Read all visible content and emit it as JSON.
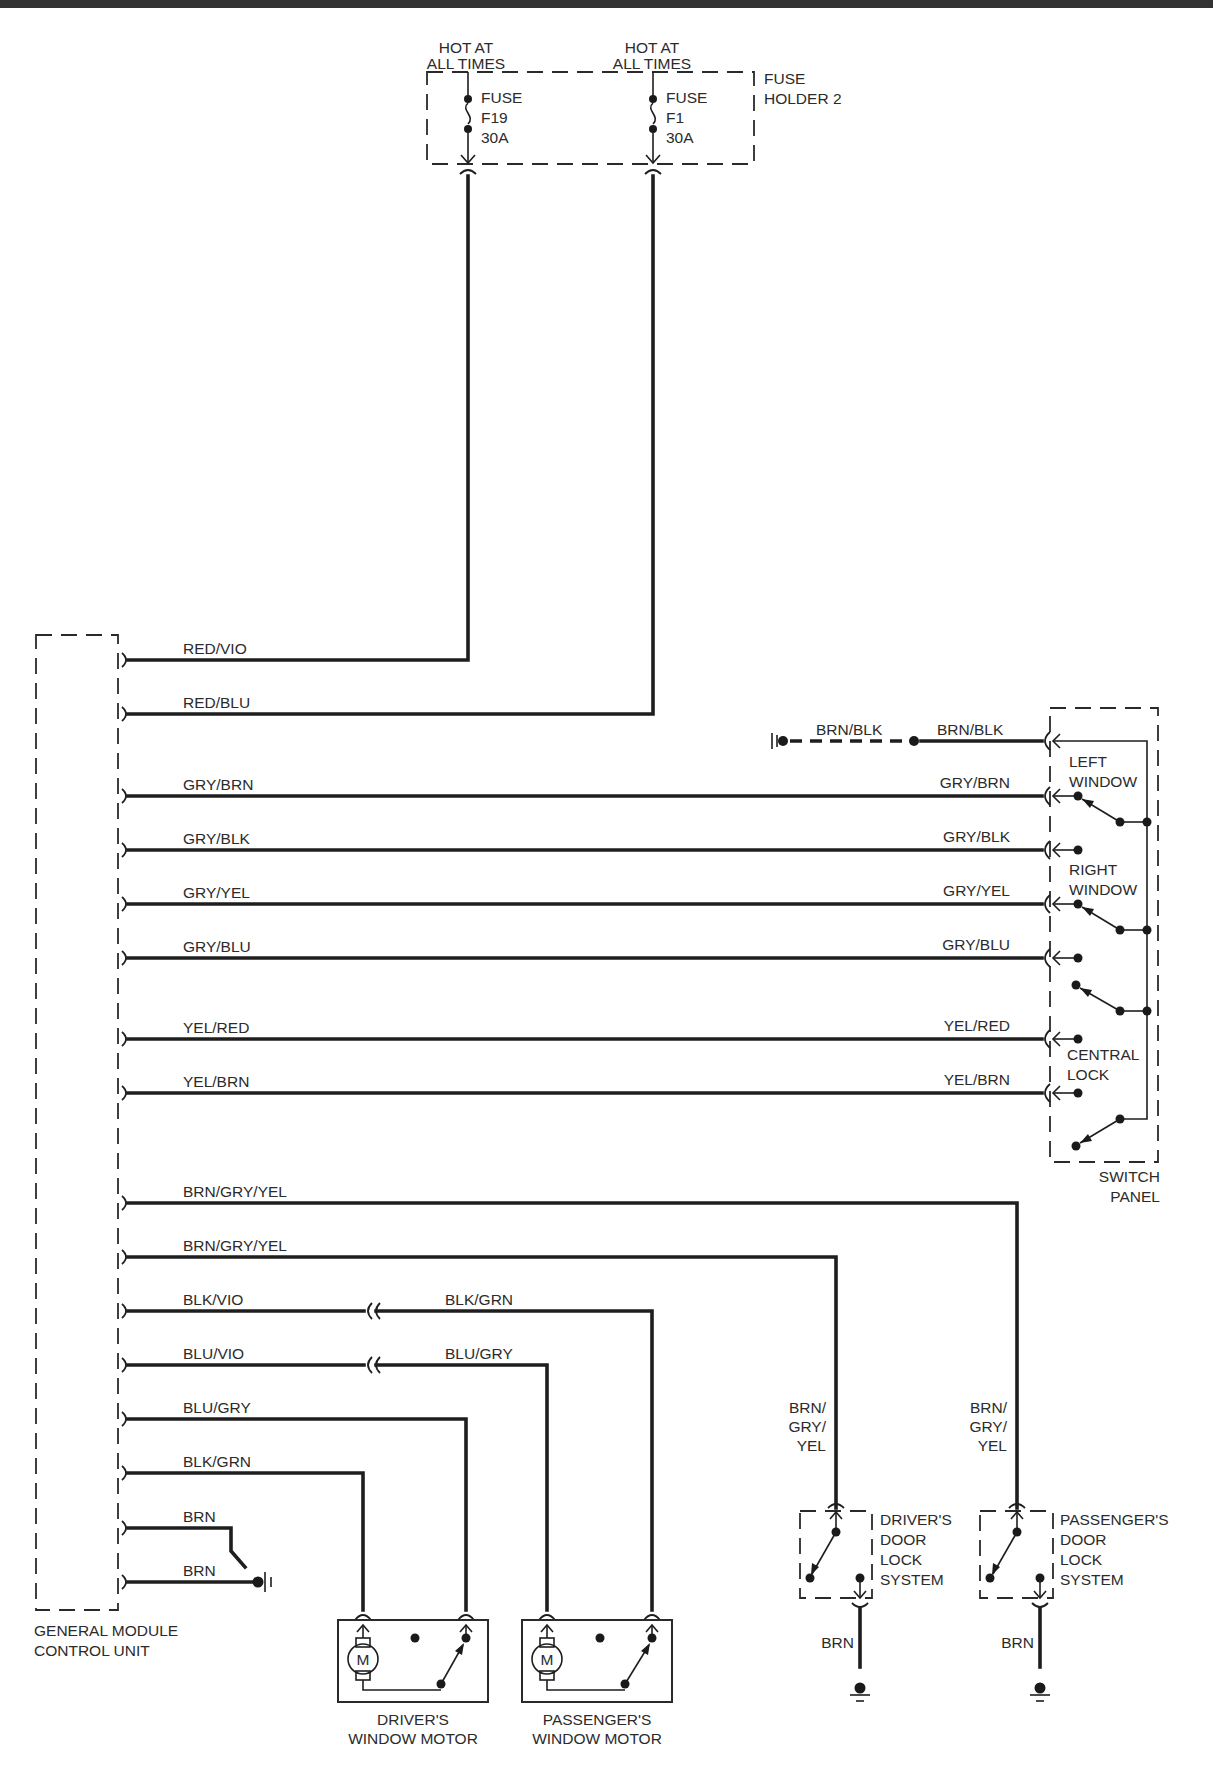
{
  "diagram": {
    "colors": {
      "ink": "#1e1e1e",
      "background": "#ffffff",
      "label": "#2b2b2b"
    },
    "power": {
      "hot_left": [
        "HOT AT",
        "ALL TIMES"
      ],
      "hot_right": [
        "HOT AT",
        "ALL TIMES"
      ],
      "fuse_left": [
        "FUSE",
        "F19",
        "30A"
      ],
      "fuse_right": [
        "FUSE",
        "F1",
        "30A"
      ],
      "fuse_holder": [
        "FUSE",
        "HOLDER 2"
      ]
    },
    "module": {
      "name": [
        "GENERAL MODULE",
        "CONTROL UNIT"
      ]
    },
    "gmcu_wires": [
      {
        "label": "RED/VIO",
        "to": "FUSE F19"
      },
      {
        "label": "RED/BLU",
        "to": "FUSE F1"
      },
      {
        "label": "GRY/BRN",
        "to": "SWITCH PANEL"
      },
      {
        "label": "GRY/BLK",
        "to": "SWITCH PANEL"
      },
      {
        "label": "GRY/YEL",
        "to": "SWITCH PANEL"
      },
      {
        "label": "GRY/BLU",
        "to": "SWITCH PANEL"
      },
      {
        "label": "YEL/RED",
        "to": "SWITCH PANEL"
      },
      {
        "label": "YEL/BRN",
        "to": "SWITCH PANEL"
      },
      {
        "label": "BRN/GRY/YEL",
        "to": "PASSENGER'S DOOR LOCK SYSTEM"
      },
      {
        "label": "BRN/GRY/YEL",
        "to": "DRIVER'S DOOR LOCK SYSTEM"
      },
      {
        "label": "BLK/VIO",
        "to": "PASSENGER'S WINDOW MOTOR"
      },
      {
        "label": "BLU/VIO",
        "to": "PASSENGER'S WINDOW MOTOR"
      },
      {
        "label": "BLU/GRY",
        "to": "DRIVER'S WINDOW MOTOR"
      },
      {
        "label": "BLK/GRN",
        "to": "DRIVER'S WINDOW MOTOR"
      },
      {
        "label": "BRN",
        "to": "GROUND"
      },
      {
        "label": "BRN",
        "to": "GROUND"
      }
    ],
    "switch_panel": {
      "name": [
        "SWITCH",
        "PANEL"
      ],
      "ground_wire_left": "BRN/BLK",
      "ground_wire_right": "BRN/BLK",
      "wire_labels": [
        "GRY/BRN",
        "GRY/BLK",
        "GRY/YEL",
        "GRY/BLU",
        "YEL/RED",
        "YEL/BRN"
      ],
      "sections": {
        "left_window": [
          "LEFT",
          "WINDOW"
        ],
        "right_window": [
          "RIGHT",
          "WINDOW"
        ],
        "central_lock": [
          "CENTRAL",
          "LOCK"
        ]
      }
    },
    "in_line_wires": {
      "blk_grn": "BLK/GRN",
      "blu_gry": "BLU/GRY"
    },
    "door_locks": {
      "driver": {
        "name": [
          "DRIVER'S",
          "DOOR",
          "LOCK",
          "SYSTEM"
        ],
        "wire": [
          "BRN/",
          "GRY/",
          "YEL"
        ],
        "ground_wire": "BRN"
      },
      "passenger": {
        "name": [
          "PASSENGER'S",
          "DOOR",
          "LOCK",
          "SYSTEM"
        ],
        "wire": [
          "BRN/",
          "GRY/",
          "YEL"
        ],
        "ground_wire": "BRN"
      }
    },
    "motors": {
      "driver": {
        "name": [
          "DRIVER'S",
          "WINDOW MOTOR"
        ],
        "symbol": "M"
      },
      "passenger": {
        "name": [
          "PASSENGER'S",
          "WINDOW MOTOR"
        ],
        "symbol": "M"
      }
    }
  }
}
